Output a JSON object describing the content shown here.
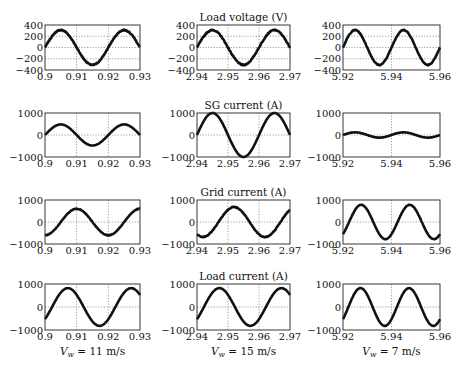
{
  "chart_data": {
    "type": "line",
    "layout": "grid 4 rows x 3 columns",
    "column_captions": [
      {
        "var": "V",
        "sub": "w",
        "rest": " = 11 m/s"
      },
      {
        "var": "V",
        "sub": "w",
        "rest": " = 15 m/s"
      },
      {
        "var": "V",
        "sub": "w",
        "rest": " = 7 m/s"
      }
    ],
    "columns": [
      {
        "xlim": [
          0.9,
          0.93
        ],
        "xticks": [
          "0.9",
          "0.91",
          "0.92",
          "0.93"
        ],
        "xtick_values": [
          0.9,
          0.91,
          0.92,
          0.93
        ]
      },
      {
        "xlim": [
          2.94,
          2.97
        ],
        "xticks": [
          "2.94",
          "2.95",
          "2.96",
          "2.97"
        ],
        "xtick_values": [
          2.94,
          2.95,
          2.96,
          2.97
        ]
      },
      {
        "xlim": [
          5.92,
          5.96
        ],
        "xticks": [
          "5.92",
          "5.94",
          "5.96"
        ],
        "xtick_values": [
          5.92,
          5.94,
          5.96
        ]
      }
    ],
    "rows": [
      {
        "title": "Load voltage (V)",
        "ylim": [
          -400,
          400
        ],
        "yticks": [
          "400",
          "200",
          "0",
          "−200",
          "−400"
        ],
        "ytick_values": [
          400,
          200,
          0,
          -200,
          -400
        ],
        "series": [
          {
            "name": "Load voltage, Vw=11 m/s",
            "amplitude": 310,
            "frequency_hz": 50,
            "phase_deg": 0,
            "noise": 18
          },
          {
            "name": "Load voltage, Vw=15 m/s",
            "amplitude": 310,
            "frequency_hz": 50,
            "phase_deg": 0,
            "noise": 18
          },
          {
            "name": "Load voltage, Vw=7 m/s",
            "amplitude": 310,
            "frequency_hz": 50,
            "phase_deg": 0,
            "noise": 14
          }
        ]
      },
      {
        "title": "SG current (A)",
        "ylim": [
          -1000,
          1000
        ],
        "yticks": [
          "1000",
          "0",
          "−1000"
        ],
        "ytick_values": [
          1000,
          0,
          -1000
        ],
        "series": [
          {
            "name": "SG current, Vw=11 m/s",
            "amplitude": 480,
            "frequency_hz": 50,
            "phase_deg": 0,
            "noise": 8
          },
          {
            "name": "SG current, Vw=15 m/s",
            "amplitude": 1000,
            "frequency_hz": 50,
            "phase_deg": 0,
            "noise": 10
          },
          {
            "name": "SG current, Vw=7 m/s",
            "amplitude": 120,
            "frequency_hz": 50,
            "phase_deg": 0,
            "noise": 8
          }
        ]
      },
      {
        "title": "Grid current (A)",
        "ylim": [
          -1000,
          1000
        ],
        "yticks": [
          "1000",
          "0",
          "−1000"
        ],
        "ytick_values": [
          1000,
          0,
          -1000
        ],
        "series": [
          {
            "name": "Grid current, Vw=11 m/s",
            "amplitude": 600,
            "frequency_hz": 50,
            "phase_deg": -90,
            "noise": 25
          },
          {
            "name": "Grid current, Vw=15 m/s",
            "amplitude": 680,
            "frequency_hz": 50,
            "phase_deg": -125,
            "noise": 35
          },
          {
            "name": "Grid current, Vw=7 m/s",
            "amplitude": 780,
            "frequency_hz": 50,
            "phase_deg": -45,
            "noise": 10
          }
        ]
      },
      {
        "title": "Load current (A)",
        "ylim": [
          -1000,
          1000
        ],
        "yticks": [
          "1000",
          "0",
          "−1000"
        ],
        "ytick_values": [
          1000,
          0,
          -1000
        ],
        "series": [
          {
            "name": "Load current, Vw=11 m/s",
            "amplitude": 820,
            "frequency_hz": 50,
            "phase_deg": -40,
            "noise": 10
          },
          {
            "name": "Load current, Vw=15 m/s",
            "amplitude": 820,
            "frequency_hz": 50,
            "phase_deg": -40,
            "noise": 10
          },
          {
            "name": "Load current, Vw=7 m/s",
            "amplitude": 820,
            "frequency_hz": 50,
            "phase_deg": -40,
            "noise": 10
          }
        ]
      }
    ],
    "grid": "dotted at ticks",
    "line_color": "#111111"
  }
}
